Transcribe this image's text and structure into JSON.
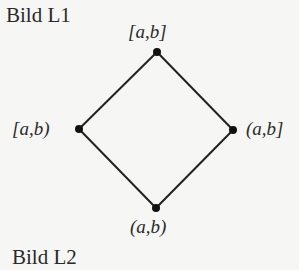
{
  "captions": {
    "top": "Bild L1",
    "bottom": "Bild L2"
  },
  "diagram": {
    "type": "hasse-diagram",
    "nodes": [
      {
        "id": "top",
        "label": "[a,b]",
        "x": 157,
        "y": 52
      },
      {
        "id": "left",
        "label": "[a,b)",
        "x": 79,
        "y": 129
      },
      {
        "id": "right",
        "label": "(a,b]",
        "x": 233,
        "y": 130
      },
      {
        "id": "bottom",
        "label": "(a,b)",
        "x": 156,
        "y": 208
      }
    ],
    "edges": [
      [
        "top",
        "left"
      ],
      [
        "top",
        "right"
      ],
      [
        "left",
        "bottom"
      ],
      [
        "right",
        "bottom"
      ]
    ],
    "line_color": "#222222"
  }
}
